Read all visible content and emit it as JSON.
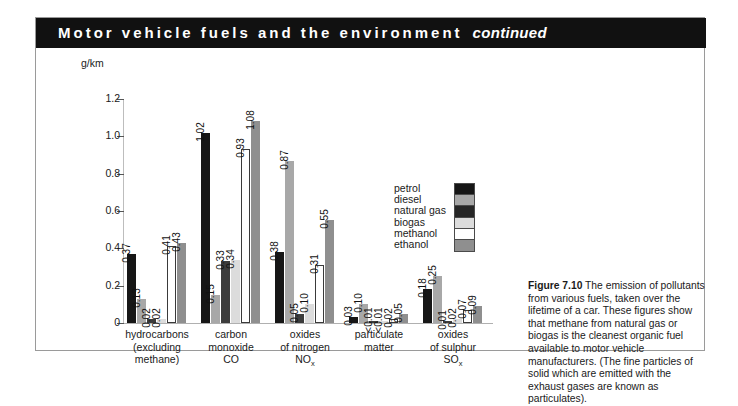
{
  "header": {
    "title": "Motor vehicle fuels and the environment",
    "continued": "continued"
  },
  "chart_data": {
    "type": "bar",
    "title": "Motor vehicle fuels and the environment",
    "ylabel": "g/km",
    "xlabel": "",
    "ylim": [
      0,
      1.2
    ],
    "yticks": [
      "0",
      "0.2",
      "0.4",
      "0.6",
      "0.8",
      "1.0",
      "1.2"
    ],
    "ytick_values": [
      0,
      0.2,
      0.4,
      0.6,
      0.8,
      1.0,
      1.2
    ],
    "grid": false,
    "legend_position": "inside-right",
    "categories": [
      "hydrocarbons (excluding methane)",
      "carbon monoxide CO",
      "oxides of nitrogen NOx",
      "particulate matter",
      "oxides of sulphur SOx"
    ],
    "category_lines": [
      [
        "hydrocarbons",
        "(excluding",
        "methane)"
      ],
      [
        "carbon",
        "monoxide",
        "CO"
      ],
      [
        "oxides",
        "of nitrogen",
        "NO|x"
      ],
      [
        "particulate",
        "matter",
        ""
      ],
      [
        "oxides",
        "of sulphur",
        "SO|x"
      ]
    ],
    "series": [
      {
        "name": "petrol",
        "color": "#161616",
        "values": [
          0.37,
          1.02,
          0.38,
          0.03,
          0.18
        ],
        "labels": [
          "0.37",
          "1.02",
          "0.38",
          "0.03",
          "0.18"
        ]
      },
      {
        "name": "diesel",
        "color": "#a8a8a8",
        "values": [
          0.13,
          0.15,
          0.87,
          0.1,
          0.25
        ],
        "labels": [
          "0.13",
          "0.15",
          "0.87",
          "0.10",
          "0.25"
        ]
      },
      {
        "name": "natural gas",
        "color": "#3c3c3c",
        "values": [
          0.02,
          0.33,
          0.05,
          0.006,
          0.01
        ],
        "labels": [
          "0.02",
          "0.33",
          "0.05",
          "<0.01",
          "0.01"
        ]
      },
      {
        "name": "biogas",
        "color": "#dcdcdc",
        "values": [
          0.02,
          0.34,
          0.1,
          0.006,
          0.02
        ],
        "labels": [
          "0.02",
          "0.34",
          "0.10",
          "<0.01",
          "0.02"
        ]
      },
      {
        "name": "methanol",
        "color": "#ffffff",
        "values": [
          0.41,
          0.93,
          0.31,
          0.02,
          0.07
        ],
        "labels": [
          "0.41",
          "0.93",
          "0.31",
          "0.02",
          "0.07"
        ]
      },
      {
        "name": "ethanol",
        "color": "#8f8f8f",
        "values": [
          0.43,
          1.08,
          0.55,
          0.05,
          0.09
        ],
        "labels": [
          "0.43",
          "1.08",
          "0.55",
          "0.05",
          "0.09"
        ]
      }
    ]
  },
  "legend": {
    "items": [
      {
        "label": "petrol",
        "color": "#161616"
      },
      {
        "label": "diesel",
        "color": "#a8a8a8"
      },
      {
        "label": "natural gas",
        "color": "#262626"
      },
      {
        "label": "biogas",
        "color": "#dcdcdc"
      },
      {
        "label": "methanol",
        "color": "#ffffff"
      },
      {
        "label": "ethanol",
        "color": "#8f8f8f"
      }
    ]
  },
  "caption": {
    "title": "Figure 7.10",
    "body": "The emission of pollutants from various fuels, taken over the lifetime of a car. These figures show that methane from natural gas or biogas is the cleanest organic fuel available to motor vehicle manufacturers. (The fine particles of solid which are emitted with the exhaust gases are known as particulates)."
  }
}
